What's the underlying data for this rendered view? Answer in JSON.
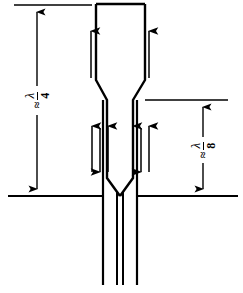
{
  "figure": {
    "type": "line-diagram",
    "background": "#ffffff",
    "stroke_color": "#000000",
    "width": 243,
    "height": 293
  },
  "dimensions": {
    "left": {
      "name": "quarter-wavelength-dimension",
      "approx_symbol": "≈",
      "numerator": "λ",
      "denominator": "4",
      "text": "≈ λ/4",
      "orientation": "vertical",
      "extension_top_y": 5,
      "extension_bottom_y": 196,
      "arrow_x": 37
    },
    "right": {
      "name": "eighth-wavelength-dimension",
      "approx_symbol": "≈",
      "numerator": "λ",
      "denominator": "8",
      "text": "≈ λ/8",
      "orientation": "vertical",
      "extension_top_y": 100,
      "extension_bottom_y": 196,
      "arrow_x": 203
    }
  },
  "ground_plane": {
    "name": "ground-plane-line",
    "y": 196,
    "x_start": 8,
    "x_end": 238
  },
  "horn": {
    "name": "tapered-horn-outline",
    "mouth_y": 4,
    "mouth_left_x": 96,
    "mouth_right_x": 145,
    "taper_start_y": 80,
    "taper_end_y": 100,
    "throat_left_x": 107,
    "throat_right_x": 133,
    "v_junction_start_y": 178,
    "v_junction_end_y": 196,
    "center_x": 120
  },
  "inner_walls": {
    "name": "inner-conductor-walls",
    "left_x": 103,
    "right_x": 137,
    "top_y": 100,
    "bottom_y": 196
  },
  "lower_stubs": {
    "name": "lower-parallel-lines",
    "left_x": 103,
    "right_x": 137,
    "center_left_x": 117,
    "center_right_x": 123,
    "top_y": 196,
    "bottom_y": 285
  },
  "arrows": {
    "upper_pair": [
      {
        "name": "arrow-up-horn-left",
        "x": 91,
        "y_tail": 78,
        "y_head": 29,
        "dir": "up"
      },
      {
        "name": "arrow-up-horn-right",
        "x": 149,
        "y_tail": 78,
        "y_head": 29,
        "dir": "up"
      }
    ],
    "throat_group_left": [
      {
        "name": "arrow-up-throat-left-outer",
        "x": 92,
        "y_tail": 172,
        "y_head": 124,
        "dir": "up"
      },
      {
        "name": "arrow-down-throat-left-mid",
        "x": 100,
        "y_tail": 128,
        "y_head": 174,
        "dir": "down"
      },
      {
        "name": "arrow-up-throat-left-inner",
        "x": 107,
        "y_tail": 172,
        "y_head": 124,
        "dir": "up"
      }
    ],
    "throat_group_right": [
      {
        "name": "arrow-up-throat-right-inner",
        "x": 134,
        "y_tail": 172,
        "y_head": 124,
        "dir": "up"
      },
      {
        "name": "arrow-down-throat-right-mid",
        "x": 141,
        "y_tail": 128,
        "y_head": 174,
        "dir": "down"
      },
      {
        "name": "arrow-up-throat-right-outer",
        "x": 149,
        "y_tail": 172,
        "y_head": 124,
        "dir": "up"
      }
    ]
  }
}
